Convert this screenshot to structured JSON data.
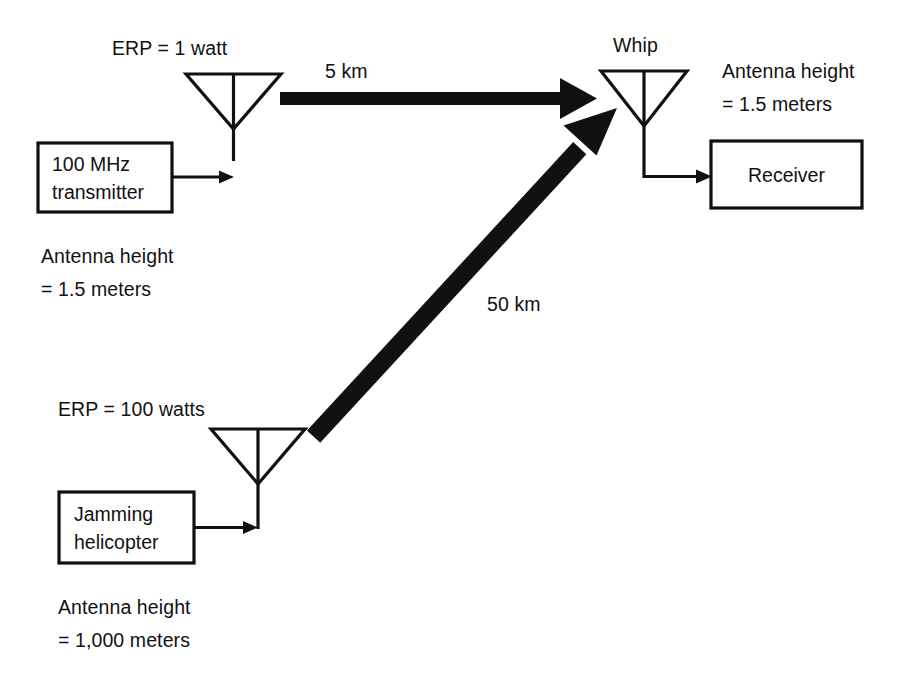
{
  "diagram": {
    "ink_color": "#111111",
    "background_color": "#ffffff"
  },
  "transmitter_site": {
    "erp_label": "ERP = 1 watt",
    "box_line_1": "100 MHz",
    "box_line_2": "transmitter",
    "antenna_height_line_1": "Antenna height",
    "antenna_height_line_2": "= 1.5 meters",
    "antenna_icon": "dipole-antenna-icon"
  },
  "receiver_site": {
    "antenna_name": "Whip",
    "antenna_height_line_1": "Antenna height",
    "antenna_height_line_2": "= 1.5 meters",
    "box_label": "Receiver",
    "antenna_icon": "whip-antenna-icon"
  },
  "jammer_site": {
    "erp_label": "ERP = 100 watts",
    "box_line_1": "Jamming",
    "box_line_2": "helicopter",
    "antenna_height_line_1": "Antenna height",
    "antenna_height_line_2": "= 1,000 meters",
    "antenna_icon": "dipole-antenna-icon"
  },
  "paths": [
    {
      "id": "signal-path",
      "label": "5 km",
      "from": "transmitter-antenna",
      "to": "whip-antenna",
      "orientation": "horizontal"
    },
    {
      "id": "jamming-path",
      "label": "50 km",
      "from": "jammer-antenna",
      "to": "whip-antenna",
      "orientation": "diagonal"
    }
  ]
}
